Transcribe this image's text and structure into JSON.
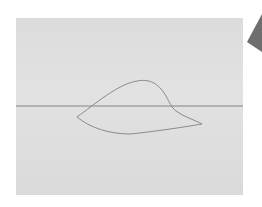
{
  "diagram": {
    "colors": {
      "background": "#ffffff",
      "panel": "#dedede",
      "line": "#7a7a7a",
      "outline": "#8a8a8a",
      "corner_shape": "#6e6e6e"
    },
    "panel": {
      "x": 16,
      "y": 18,
      "width": 227,
      "height": 177
    },
    "horizon_line": {
      "y": 106,
      "x1": 16,
      "x2": 243
    },
    "shape_points": [
      [
        76,
        117
      ],
      [
        140,
        81
      ],
      [
        172,
        105
      ],
      [
        202,
        124
      ],
      [
        128,
        134
      ]
    ],
    "corner_shape": "dark-triangle-top-right"
  }
}
